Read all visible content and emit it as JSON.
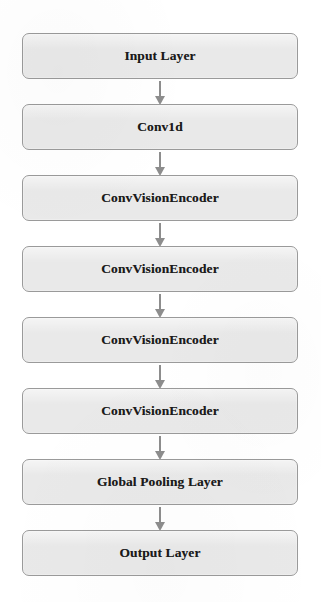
{
  "diagram": {
    "type": "vertical-flowchart",
    "orientation": "top-to-bottom",
    "background_color": "#ffffff",
    "node_fill_color": "#e9e9e9",
    "node_border_color": "#9a9a9a",
    "node_text_color": "#1b1b1b",
    "arrow_color": "#8d8d8d",
    "node_count": 8,
    "arrow_count": 7,
    "nodes": [
      {
        "id": "input-layer",
        "label": "Input Layer"
      },
      {
        "id": "conv1d",
        "label": "Conv1d"
      },
      {
        "id": "conv-vision-encoder-1",
        "label": "ConvVisionEncoder"
      },
      {
        "id": "conv-vision-encoder-2",
        "label": "ConvVisionEncoder"
      },
      {
        "id": "conv-vision-encoder-3",
        "label": "ConvVisionEncoder"
      },
      {
        "id": "conv-vision-encoder-4",
        "label": "ConvVisionEncoder"
      },
      {
        "id": "global-pooling-layer",
        "label": "Global Pooling Layer"
      },
      {
        "id": "output-layer",
        "label": "Output Layer"
      }
    ],
    "edges": [
      {
        "from": "input-layer",
        "to": "conv1d"
      },
      {
        "from": "conv1d",
        "to": "conv-vision-encoder-1"
      },
      {
        "from": "conv-vision-encoder-1",
        "to": "conv-vision-encoder-2"
      },
      {
        "from": "conv-vision-encoder-2",
        "to": "conv-vision-encoder-3"
      },
      {
        "from": "conv-vision-encoder-3",
        "to": "conv-vision-encoder-4"
      },
      {
        "from": "conv-vision-encoder-4",
        "to": "global-pooling-layer"
      },
      {
        "from": "global-pooling-layer",
        "to": "output-layer"
      }
    ]
  }
}
